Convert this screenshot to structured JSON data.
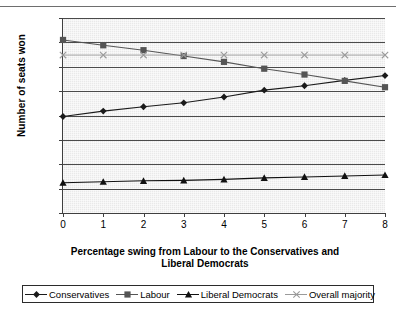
{
  "chart_data": {
    "type": "line",
    "title": "",
    "xlabel": "Percentage swing from Labour to the Conservatives and Liberal Democrats",
    "ylabel": "Number of seats won",
    "x": [
      0,
      1,
      2,
      3,
      4,
      5,
      6,
      7,
      8
    ],
    "xlim": [
      0,
      8
    ],
    "ylim": [
      0,
      400
    ],
    "yticks": [
      0,
      50,
      100,
      150,
      200,
      250,
      300,
      350,
      400
    ],
    "xticks": [
      0,
      1,
      2,
      3,
      4,
      5,
      6,
      7,
      8
    ],
    "grid": true,
    "legend_position": "bottom",
    "series": [
      {
        "name": "Conservatives",
        "marker": "diamond",
        "color": "#1a1a1a",
        "values": [
          198,
          209,
          218,
          226,
          238,
          252,
          261,
          272,
          282
        ]
      },
      {
        "name": "Labour",
        "marker": "square",
        "color": "#555555",
        "values": [
          355,
          344,
          334,
          322,
          310,
          296,
          284,
          271,
          258
        ]
      },
      {
        "name": "Liberal Democrats",
        "marker": "triangle",
        "color": "#111111",
        "values": [
          62,
          64,
          66,
          67,
          69,
          72,
          74,
          76,
          78
        ]
      },
      {
        "name": "Overall majority",
        "marker": "x",
        "color": "#9a9a9a",
        "values": [
          324,
          324,
          324,
          324,
          324,
          324,
          324,
          324,
          324
        ]
      }
    ]
  },
  "axis": {
    "ylabel": "Number of seats won",
    "xlabel_line1": "Percentage swing from Labour to the Conservatives and",
    "xlabel_line2": "Liberal Democrats",
    "ytick_labels": [
      "400",
      "350",
      "300",
      "250",
      "200",
      "150",
      "100",
      "50",
      "0"
    ],
    "xtick_labels": [
      "0",
      "1",
      "2",
      "3",
      "4",
      "5",
      "6",
      "7",
      "8"
    ]
  },
  "legend": {
    "items": [
      {
        "label": "Conservatives",
        "marker": "diamond-marker",
        "color": "#1a1a1a"
      },
      {
        "label": "Labour",
        "marker": "square-marker",
        "color": "#555555"
      },
      {
        "label": "Liberal Democrats",
        "marker": "triangle-marker",
        "color": "#111111"
      },
      {
        "label": "Overall majority",
        "marker": "x-marker",
        "color": "#9a9a9a"
      }
    ]
  },
  "colors": {
    "plot_background": "#e9e9e9",
    "axis": "#404040",
    "gridline": "#4a4a4a",
    "conservatives": "#1a1a1a",
    "labour": "#555555",
    "liberal_democrats": "#111111",
    "overall_majority": "#9a9a9a"
  }
}
